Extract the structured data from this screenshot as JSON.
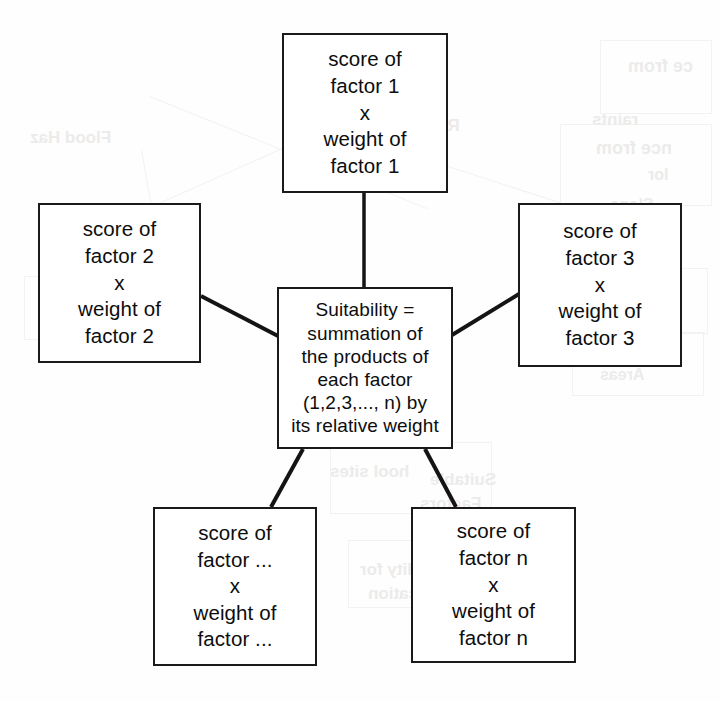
{
  "diagram": {
    "type": "concept-diagram",
    "title_text": "",
    "nodes": [
      {
        "id": "center",
        "name": "suitability-formula-node",
        "lines": [
          "Suitability =",
          "summation of",
          "the products of",
          "each factor",
          "(1,2,3,..., n) by",
          "its relative weight"
        ]
      },
      {
        "id": "top",
        "name": "factor-1-node",
        "lines": [
          "score of",
          "factor 1",
          "x",
          "weight of",
          "factor 1"
        ]
      },
      {
        "id": "left",
        "name": "factor-2-node",
        "lines": [
          "score of",
          "factor 2",
          "x",
          "weight of",
          "factor 2"
        ]
      },
      {
        "id": "right",
        "name": "factor-3-node",
        "lines": [
          "score of",
          "factor 3",
          "x",
          "weight of",
          "factor 3"
        ]
      },
      {
        "id": "bottomleft",
        "name": "factor-ellipsis-node",
        "lines": [
          "score of",
          "factor ...",
          "x",
          "weight of",
          "factor ..."
        ]
      },
      {
        "id": "bottomright",
        "name": "factor-n-node",
        "lines": [
          "score of",
          "factor n",
          "x",
          "weight of",
          "factor n"
        ]
      }
    ],
    "edges": [
      {
        "from": "top",
        "to": "center",
        "style": "straight-line"
      },
      {
        "from": "left",
        "to": "center",
        "style": "straight-line"
      },
      {
        "from": "right",
        "to": "center",
        "style": "straight-line"
      },
      {
        "from": "bottomleft",
        "to": "center",
        "style": "straight-line"
      },
      {
        "from": "bottomright",
        "to": "center",
        "style": "straight-line"
      }
    ],
    "colors": {
      "box_border": "#1a1a1a",
      "box_fill": "#ffffff",
      "connector": "#141414",
      "text": "#0d0d0d",
      "page_background": "#fefefe",
      "bleed_through": "#ecebea"
    }
  },
  "background_bleed": {
    "note": "faint mirrored show-through from the reverse side of the scanned page",
    "fragments": [
      {
        "text": "Flood Haz",
        "x": 30,
        "y": 128,
        "size": 17
      },
      {
        "text": "raints",
        "x": 592,
        "y": 110,
        "size": 17
      },
      {
        "text": "ce from",
        "x": 628,
        "y": 56,
        "size": 18
      },
      {
        "text": "nce from",
        "x": 596,
        "y": 138,
        "size": 18
      },
      {
        "text": "lor",
        "x": 648,
        "y": 166,
        "size": 16
      },
      {
        "text": "Slope",
        "x": 610,
        "y": 196,
        "size": 16
      },
      {
        "text": "Road Constraints",
        "x": 318,
        "y": 116,
        "size": 17
      },
      {
        "text": "Distance from",
        "x": 300,
        "y": 140,
        "size": 16
      },
      {
        "text": "or",
        "x": 60,
        "y": 300,
        "size": 15
      },
      {
        "text": "ility",
        "x": 40,
        "y": 320,
        "size": 15
      },
      {
        "text": "uitable",
        "x": 590,
        "y": 282,
        "size": 17
      },
      {
        "text": "sites",
        "x": 600,
        "y": 306,
        "size": 16
      },
      {
        "text": "Land",
        "x": 604,
        "y": 344,
        "size": 16
      },
      {
        "text": "Areas",
        "x": 600,
        "y": 366,
        "size": 16
      },
      {
        "text": "hool sites",
        "x": 330,
        "y": 462,
        "size": 17
      },
      {
        "text": "uitability for",
        "x": 360,
        "y": 560,
        "size": 17
      },
      {
        "text": "Classification",
        "x": 368,
        "y": 584,
        "size": 17
      },
      {
        "text": "Suitable",
        "x": 430,
        "y": 470,
        "size": 17
      },
      {
        "text": "Factors",
        "x": 420,
        "y": 494,
        "size": 17
      }
    ]
  }
}
